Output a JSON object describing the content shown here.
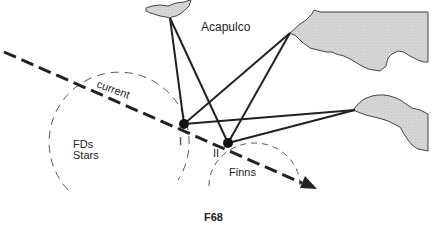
{
  "diagram": {
    "labels": {
      "acapulco": "Acapulco",
      "current": "current",
      "fds": "FDs",
      "stars": "Stars",
      "finns": "Finns",
      "position_one": "I",
      "position_two": "II",
      "figure_id": "F68"
    },
    "colors": {
      "land_fill": "#d4d4d4",
      "land_stroke": "#444444",
      "line": "#222222",
      "dashed_circle": "#555555"
    }
  }
}
